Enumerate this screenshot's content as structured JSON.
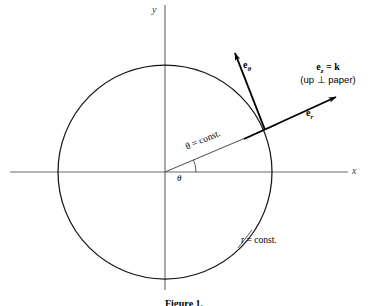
{
  "figure": {
    "caption": "Figure 1.",
    "axes": {
      "x_label": "x",
      "y_label": "y"
    },
    "labels": {
      "e_theta": {
        "base": "e",
        "sub": "θ"
      },
      "e_r": {
        "base": "e",
        "sub": "r"
      },
      "e_z": {
        "line1_base": "e",
        "line1_sub": "z",
        "line1_rest": " = k",
        "line2": "(up ⊥ paper)"
      },
      "theta_const": "θ = const.",
      "r_const": "r = const.",
      "theta_angle": "θ"
    },
    "geometry": {
      "origin": [
        165,
        172
      ],
      "circle_radius": 107,
      "theta_degrees": 23,
      "x_axis_span": [
        10,
        348
      ],
      "y_axis_span": [
        5,
        290
      ]
    },
    "colors": {
      "ink": "#000000",
      "axis": "#5a5a5a",
      "circle": "#1a1a1a",
      "background": "#ffffff"
    }
  }
}
